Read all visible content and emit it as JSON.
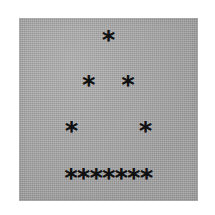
{
  "canvas": {
    "width": 215,
    "height": 215,
    "background_color": "#ffffff"
  },
  "panel": {
    "name": "scanned-gray-paper",
    "background_color": "#a8a8a8",
    "ink_color": "#111111",
    "x": 19,
    "y": 18,
    "width": 179,
    "height": 183
  },
  "ascii_art": {
    "glyph": "*",
    "subject": "letter-a",
    "rows": [
      {
        "index": 1,
        "text": "*",
        "count": 1,
        "y": 40
      },
      {
        "index": 2,
        "text": "*   *",
        "count": 2,
        "y": 85
      },
      {
        "index": 3,
        "text": "*       *",
        "count": 2,
        "y": 131
      },
      {
        "index": 4,
        "text": "*******",
        "count": 7,
        "y": 178
      }
    ],
    "total_asterisks": 12
  }
}
